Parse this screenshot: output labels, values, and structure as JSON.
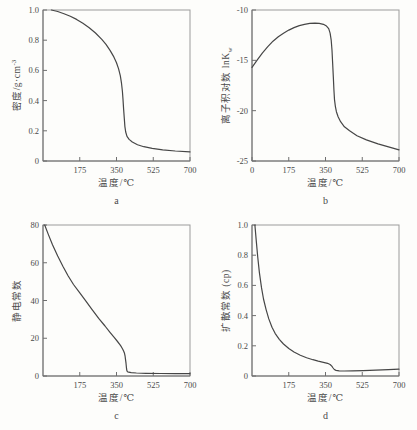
{
  "figure_caption_letters": [
    "a",
    "b",
    "c",
    "d"
  ],
  "styles": {
    "background": "#fdfdfb",
    "line_color": "#464646",
    "frame_color": "#9b9b9b",
    "axis_color": "#6f6f6f",
    "text_color": "#4a4a4a"
  },
  "chart_data": [
    {
      "type": "line",
      "panel_letter": "a",
      "xlabel": "温度/℃",
      "ylabel_pre": "密度/g·cm",
      "ylabel_sup": "-3",
      "ylabel_sub": "",
      "xlim": [
        0,
        700
      ],
      "ylim": [
        0,
        1.0
      ],
      "x_tick_values": [
        175,
        350,
        525,
        700
      ],
      "x_tick_labels": [
        "175",
        "350",
        "525",
        "700"
      ],
      "y_tick_values": [
        0,
        0.2,
        0.4,
        0.6,
        0.8,
        1.0
      ],
      "y_tick_labels": [
        "0",
        "0.2",
        "0.4",
        "0.6",
        "0.8",
        "1.0"
      ],
      "grid": false,
      "legend": null,
      "points": [
        [
          40,
          1.0
        ],
        [
          70,
          0.99
        ],
        [
          100,
          0.975
        ],
        [
          130,
          0.958
        ],
        [
          160,
          0.938
        ],
        [
          190,
          0.912
        ],
        [
          220,
          0.883
        ],
        [
          250,
          0.848
        ],
        [
          280,
          0.806
        ],
        [
          300,
          0.772
        ],
        [
          320,
          0.731
        ],
        [
          335,
          0.695
        ],
        [
          350,
          0.65
        ],
        [
          360,
          0.61
        ],
        [
          368,
          0.565
        ],
        [
          374,
          0.515
        ],
        [
          378,
          0.462
        ],
        [
          381,
          0.408
        ],
        [
          384,
          0.345
        ],
        [
          387,
          0.282
        ],
        [
          390,
          0.228
        ],
        [
          394,
          0.192
        ],
        [
          400,
          0.163
        ],
        [
          410,
          0.143
        ],
        [
          425,
          0.126
        ],
        [
          450,
          0.108
        ],
        [
          480,
          0.095
        ],
        [
          520,
          0.084
        ],
        [
          570,
          0.074
        ],
        [
          630,
          0.066
        ],
        [
          700,
          0.06
        ]
      ]
    },
    {
      "type": "line",
      "panel_letter": "b",
      "xlabel": "温度/℃",
      "ylabel_pre": "离子积对数 lnK",
      "ylabel_sup": "",
      "ylabel_sub": "w",
      "xlim": [
        0,
        700
      ],
      "ylim": [
        -25,
        -10
      ],
      "x_tick_values": [
        0,
        175,
        350,
        525,
        700
      ],
      "x_tick_labels": [
        "0",
        "175",
        "350",
        "525",
        "700"
      ],
      "y_tick_values": [
        -25,
        -20,
        -15,
        -10
      ],
      "y_tick_labels": [
        "-25",
        "-20",
        "-15",
        "-10"
      ],
      "grid": false,
      "legend": null,
      "points": [
        [
          0,
          -15.7
        ],
        [
          25,
          -14.95
        ],
        [
          50,
          -14.25
        ],
        [
          75,
          -13.65
        ],
        [
          100,
          -13.1
        ],
        [
          125,
          -12.65
        ],
        [
          150,
          -12.3
        ],
        [
          175,
          -12.0
        ],
        [
          200,
          -11.75
        ],
        [
          225,
          -11.55
        ],
        [
          250,
          -11.42
        ],
        [
          275,
          -11.33
        ],
        [
          300,
          -11.3
        ],
        [
          320,
          -11.33
        ],
        [
          340,
          -11.42
        ],
        [
          355,
          -11.6
        ],
        [
          365,
          -11.85
        ],
        [
          372,
          -12.3
        ],
        [
          377,
          -13.0
        ],
        [
          381,
          -14.0
        ],
        [
          384,
          -15.2
        ],
        [
          387,
          -16.6
        ],
        [
          390,
          -17.9
        ],
        [
          393,
          -18.9
        ],
        [
          397,
          -19.6
        ],
        [
          402,
          -20.1
        ],
        [
          410,
          -20.6
        ],
        [
          422,
          -21.1
        ],
        [
          440,
          -21.6
        ],
        [
          465,
          -22.0
        ],
        [
          500,
          -22.5
        ],
        [
          545,
          -22.9
        ],
        [
          600,
          -23.3
        ],
        [
          650,
          -23.6
        ],
        [
          700,
          -23.9
        ]
      ]
    },
    {
      "type": "line",
      "panel_letter": "c",
      "xlabel": "温度/℃",
      "ylabel_pre": "静电常数",
      "ylabel_sup": "",
      "ylabel_sub": "",
      "xlim": [
        0,
        700
      ],
      "ylim": [
        0,
        80
      ],
      "x_tick_values": [
        175,
        350,
        525,
        700
      ],
      "x_tick_labels": [
        "175",
        "350",
        "525",
        "700"
      ],
      "y_tick_values": [
        0,
        20,
        40,
        60,
        80
      ],
      "y_tick_labels": [
        "0",
        "20",
        "40",
        "60",
        "80"
      ],
      "grid": false,
      "legend": null,
      "points": [
        [
          8,
          80
        ],
        [
          25,
          75
        ],
        [
          45,
          69.5
        ],
        [
          70,
          63.5
        ],
        [
          95,
          58
        ],
        [
          120,
          53
        ],
        [
          145,
          48.5
        ],
        [
          175,
          44
        ],
        [
          205,
          39.5
        ],
        [
          235,
          35
        ],
        [
          265,
          30.5
        ],
        [
          295,
          26.5
        ],
        [
          320,
          23
        ],
        [
          340,
          20.3
        ],
        [
          355,
          18.3
        ],
        [
          365,
          16.8
        ],
        [
          373,
          15.5
        ],
        [
          379,
          14.3
        ],
        [
          384,
          13.2
        ],
        [
          388,
          12.0
        ],
        [
          391,
          10.5
        ],
        [
          393,
          8.8
        ],
        [
          395,
          6.8
        ],
        [
          397,
          4.6
        ],
        [
          399,
          3.0
        ],
        [
          402,
          2.3
        ],
        [
          408,
          2.0
        ],
        [
          420,
          1.8
        ],
        [
          445,
          1.6
        ],
        [
          490,
          1.45
        ],
        [
          560,
          1.3
        ],
        [
          630,
          1.25
        ],
        [
          700,
          1.2
        ]
      ]
    },
    {
      "type": "line",
      "panel_letter": "d",
      "xlabel": "温度/℃",
      "ylabel_pre": "扩散常数 (cp)",
      "ylabel_sup": "",
      "ylabel_sub": "",
      "xlim": [
        0,
        700
      ],
      "ylim": [
        0,
        1.0
      ],
      "x_tick_values": [
        175,
        350,
        525,
        700
      ],
      "x_tick_labels": [
        "175",
        "350",
        "525",
        "700"
      ],
      "y_tick_values": [
        0,
        0.2,
        0.4,
        0.6,
        0.8,
        1.0
      ],
      "y_tick_labels": [
        "0",
        "0.2",
        "0.4",
        "0.6",
        "0.8",
        "1.0"
      ],
      "grid": false,
      "legend": null,
      "points": [
        [
          14,
          1.0
        ],
        [
          20,
          0.9
        ],
        [
          27,
          0.79
        ],
        [
          35,
          0.685
        ],
        [
          45,
          0.585
        ],
        [
          55,
          0.51
        ],
        [
          67,
          0.44
        ],
        [
          80,
          0.378
        ],
        [
          95,
          0.323
        ],
        [
          110,
          0.283
        ],
        [
          130,
          0.243
        ],
        [
          150,
          0.212
        ],
        [
          175,
          0.182
        ],
        [
          200,
          0.159
        ],
        [
          230,
          0.138
        ],
        [
          260,
          0.121
        ],
        [
          290,
          0.108
        ],
        [
          315,
          0.099
        ],
        [
          340,
          0.091
        ],
        [
          360,
          0.084
        ],
        [
          372,
          0.076
        ],
        [
          380,
          0.065
        ],
        [
          386,
          0.053
        ],
        [
          392,
          0.043
        ],
        [
          400,
          0.037
        ],
        [
          415,
          0.034
        ],
        [
          440,
          0.033
        ],
        [
          480,
          0.034
        ],
        [
          530,
          0.036
        ],
        [
          590,
          0.039
        ],
        [
          650,
          0.042
        ],
        [
          700,
          0.045
        ]
      ]
    }
  ]
}
